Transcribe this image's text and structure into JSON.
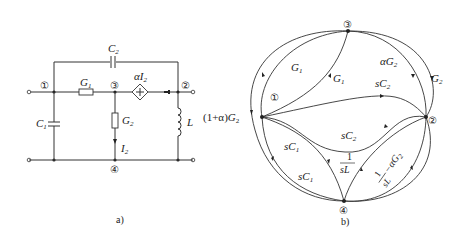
{
  "figure_a": {
    "caption": "a)",
    "nodes": {
      "n1": "①",
      "n2": "②",
      "n3": "③",
      "n4": "④"
    },
    "components": {
      "C2": {
        "sym": "C",
        "sub": "2"
      },
      "G1": {
        "sym": "G",
        "sub": "1"
      },
      "G2": {
        "sym": "G",
        "sub": "2"
      },
      "C1": {
        "sym": "C",
        "sub": "1"
      },
      "L": {
        "sym": "L"
      },
      "I2": {
        "sym": "I",
        "sub": "2"
      },
      "source": {
        "pre": "α",
        "sym": "I",
        "sub": "2"
      }
    }
  },
  "figure_b": {
    "caption": "b)",
    "nodes": {
      "n1": "①",
      "n2": "②",
      "n3": "③",
      "n4": "④"
    },
    "edges": {
      "outer_left": {
        "pre": "(1+α)",
        "sym": "G",
        "sub": "2"
      },
      "g1_outer": {
        "sym": "G",
        "sub": "1"
      },
      "g1_inner": {
        "sym": "G",
        "sub": "1"
      },
      "ag2": {
        "pre": "α",
        "sym": "G",
        "sub": "2"
      },
      "g2_outer": {
        "sym": "G",
        "sub": "2"
      },
      "sc2_upper": {
        "pre": "s",
        "sym": "C",
        "sub": "2"
      },
      "sc2_lower": {
        "pre": "s",
        "sym": "C",
        "sub": "2"
      },
      "sc1_inner": {
        "pre": "s",
        "sym": "C",
        "sub": "1"
      },
      "sc1_outer": {
        "pre": "s",
        "sym": "C",
        "sub": "1"
      },
      "one_over_sl": {
        "num": "1",
        "den": "sL"
      },
      "one_over_sl_minus": {
        "num": "1",
        "den": "sL",
        "rest": "−αG",
        "sub": "2"
      }
    }
  }
}
